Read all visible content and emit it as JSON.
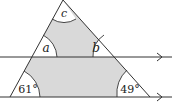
{
  "diagram": {
    "type": "geometry",
    "colors": {
      "shade": "#d9d9d9",
      "stroke": "#333333",
      "background": "#ffffff"
    },
    "angles": {
      "apex": {
        "label": "c"
      },
      "upper_left": {
        "label": "a"
      },
      "upper_right": {
        "label": "b"
      },
      "lower_left": {
        "label": "61°"
      },
      "lower_right": {
        "label": "49°"
      }
    },
    "parallel_lines": [
      {
        "name": "upper-line",
        "arrow": ">"
      },
      {
        "name": "lower-line",
        "arrow": ">"
      }
    ]
  }
}
